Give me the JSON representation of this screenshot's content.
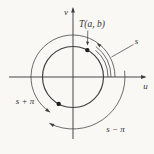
{
  "figure": {
    "labels": {
      "point": "T(a, b)",
      "axis_u": "u",
      "axis_v": "v",
      "arc_s": "s",
      "arc_s_plus_pi": "s + π",
      "arc_s_minus_pi": "s − π"
    }
  },
  "colors": {
    "line": "#3e3e3e",
    "text": "#333333",
    "background": "#f9f8f5"
  }
}
